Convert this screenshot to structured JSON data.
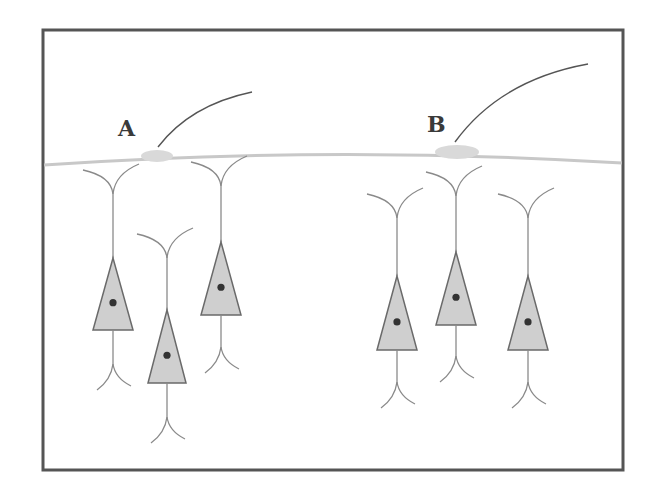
{
  "frame": {
    "x": 43,
    "y": 30,
    "width": 580,
    "height": 440,
    "stroke": "#555555",
    "stroke_width": 3
  },
  "colors": {
    "membrane": "#c8c8c8",
    "swelling": "#d9d9d9",
    "fiber": "#555555",
    "neuron_fill": "#cfcfcf",
    "neuron_stroke": "#6a6a6a",
    "process": "#8a8a8a",
    "nucleus": "#333333"
  },
  "surface_line": {
    "path": "M44,165 Q330,145 622,163"
  },
  "sites": [
    {
      "label": "A",
      "label_x": 118,
      "label_y": 136,
      "swelling_cx": 157,
      "swelling_cy": 156,
      "swelling_rx": 16,
      "swelling_ry": 6,
      "fiber_path": "M158,147 Q190,105 252,92"
    },
    {
      "label": "B",
      "label_x": 427,
      "label_y": 132,
      "swelling_cx": 457,
      "swelling_cy": 152,
      "swelling_rx": 22,
      "swelling_ry": 7,
      "fiber_path": "M455,142 Q500,80 588,64"
    }
  ],
  "neurons": [
    {
      "id": "neuron-1",
      "cx": 113,
      "top": 170,
      "apex": 258,
      "base": 330,
      "half_width": 20,
      "bottom": 390
    },
    {
      "id": "neuron-2",
      "cx": 167,
      "top": 234,
      "apex": 310,
      "base": 383,
      "half_width": 19,
      "bottom": 443
    },
    {
      "id": "neuron-3",
      "cx": 221,
      "top": 162,
      "apex": 242,
      "base": 315,
      "half_width": 20,
      "bottom": 373
    },
    {
      "id": "neuron-4",
      "cx": 397,
      "top": 194,
      "apex": 276,
      "base": 350,
      "half_width": 20,
      "bottom": 408
    },
    {
      "id": "neuron-5",
      "cx": 456,
      "top": 172,
      "apex": 252,
      "base": 325,
      "half_width": 20,
      "bottom": 382
    },
    {
      "id": "neuron-6",
      "cx": 528,
      "top": 194,
      "apex": 276,
      "base": 350,
      "half_width": 20,
      "bottom": 408
    }
  ]
}
